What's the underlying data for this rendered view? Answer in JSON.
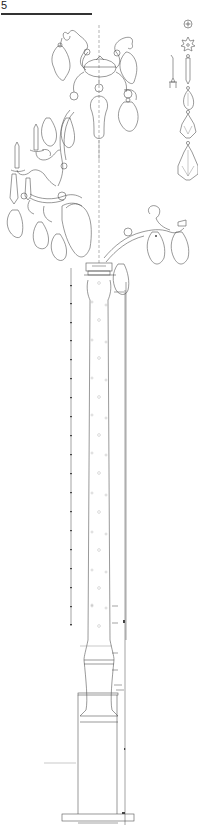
{
  "sheet": {
    "number": "5"
  },
  "drawing": {
    "subject": "chandelier column elevation",
    "line_color": "#555555",
    "background": "#ffffff"
  },
  "details": {
    "ornaments": [
      "rosette",
      "star-rosette",
      "candle-cup",
      "prism-drop",
      "teardrop-pendant",
      "bead-pendant-small",
      "bead-pendant-large"
    ]
  }
}
